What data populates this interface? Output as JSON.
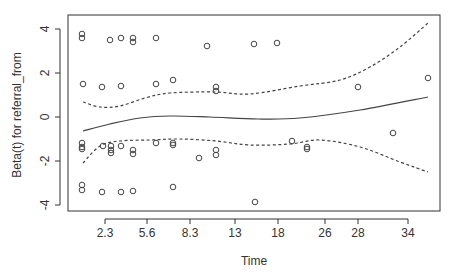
{
  "chart_data": {
    "type": "scatter",
    "title": "",
    "xlabel": "Time",
    "ylabel": "Beta(t) for referral_from",
    "x_tick_labels": [
      "2.3",
      "5.6",
      "8.3",
      "13",
      "18",
      "26",
      "28",
      "34"
    ],
    "y_tick_labels": [
      "-4",
      "-2",
      "0",
      "2",
      "4"
    ],
    "y_ticks": [
      -4,
      -2,
      0,
      2,
      4
    ],
    "ylim": [
      -4.3,
      4.6
    ],
    "grid": false,
    "legend": null,
    "series": [
      {
        "name": "residuals",
        "kind": "points",
        "style": "open-circle",
        "points_px": [
          [
            82,
            34
          ],
          [
            82,
            38
          ],
          [
            110,
            40
          ],
          [
            121,
            38
          ],
          [
            133,
            38
          ],
          [
            133,
            42
          ],
          [
            156,
            38
          ],
          [
            207,
            46
          ],
          [
            254,
            44
          ],
          [
            277,
            43
          ],
          [
            83,
            84
          ],
          [
            102,
            87
          ],
          [
            121,
            86
          ],
          [
            156,
            84
          ],
          [
            173,
            80
          ],
          [
            216,
            87
          ],
          [
            216,
            91
          ],
          [
            358,
            87
          ],
          [
            428,
            78
          ],
          [
            82,
            143
          ],
          [
            82,
            147
          ],
          [
            82,
            149
          ],
          [
            103,
            146
          ],
          [
            111,
            146
          ],
          [
            111,
            150
          ],
          [
            111,
            153
          ],
          [
            121,
            146
          ],
          [
            133,
            150
          ],
          [
            133,
            154
          ],
          [
            156,
            143
          ],
          [
            173,
            143
          ],
          [
            173,
            145
          ],
          [
            199,
            158
          ],
          [
            216,
            150
          ],
          [
            216,
            155
          ],
          [
            292,
            141
          ],
          [
            307,
            147
          ],
          [
            307,
            149
          ],
          [
            393,
            133
          ],
          [
            82,
            185
          ],
          [
            82,
            190
          ],
          [
            102,
            192
          ],
          [
            121,
            192
          ],
          [
            133,
            191
          ],
          [
            173,
            187
          ],
          [
            255,
            202
          ]
        ],
        "values": [
          3.75,
          3.55,
          3.45,
          3.55,
          3.55,
          3.4,
          3.55,
          3.2,
          3.3,
          3.35,
          1.5,
          1.35,
          1.4,
          1.5,
          1.7,
          1.35,
          1.15,
          1.35,
          1.75,
          -1.2,
          -1.35,
          -1.45,
          -1.3,
          -1.3,
          -1.5,
          -1.6,
          -1.3,
          -1.5,
          -1.7,
          -1.2,
          -1.2,
          -1.3,
          -1.85,
          -1.5,
          -1.75,
          -1.1,
          -1.35,
          -1.45,
          -0.7,
          -3.1,
          -3.35,
          -3.4,
          -3.4,
          -3.35,
          -3.2,
          -3.85
        ]
      },
      {
        "name": "beta(t) estimate",
        "kind": "line",
        "style": "solid",
        "points_px": [
          [
            83,
            131
          ],
          [
            110,
            124
          ],
          [
            140,
            118
          ],
          [
            170,
            116
          ],
          [
            210,
            117
          ],
          [
            258,
            119
          ],
          [
            300,
            118
          ],
          [
            360,
            110
          ],
          [
            428,
            97
          ]
        ]
      },
      {
        "name": "upper 95% band",
        "kind": "line",
        "style": "dashed",
        "points_px": [
          [
            83,
            102
          ],
          [
            100,
            107
          ],
          [
            120,
            106
          ],
          [
            145,
            98
          ],
          [
            170,
            93
          ],
          [
            215,
            92
          ],
          [
            250,
            94
          ],
          [
            300,
            86
          ],
          [
            340,
            80
          ],
          [
            370,
            67
          ],
          [
            400,
            47
          ],
          [
            428,
            23
          ]
        ]
      },
      {
        "name": "lower 95% band",
        "kind": "line",
        "style": "dashed",
        "points_px": [
          [
            83,
            163
          ],
          [
            100,
            146
          ],
          [
            120,
            141
          ],
          [
            150,
            140
          ],
          [
            180,
            139
          ],
          [
            216,
            141
          ],
          [
            250,
            145
          ],
          [
            290,
            144
          ],
          [
            320,
            140
          ],
          [
            360,
            147
          ],
          [
            400,
            162
          ],
          [
            428,
            172
          ]
        ]
      }
    ],
    "plot_box": {
      "x": 68,
      "y": 15,
      "w": 372,
      "h": 196
    },
    "x_tick_px": [
      105,
      147,
      190,
      235,
      278,
      325,
      358,
      408
    ],
    "y_tick_px": [
      205,
      161,
      117,
      73,
      29
    ]
  }
}
